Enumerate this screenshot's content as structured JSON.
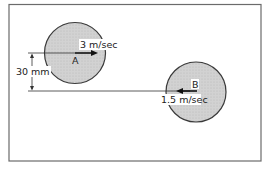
{
  "diagram": {
    "dimension_label": "30 mm",
    "disk_a": {
      "label": "A",
      "velocity_label": "3 m/sec",
      "direction": "right"
    },
    "disk_b": {
      "label": "B",
      "velocity_label": "1.5 m/sec",
      "direction": "left"
    },
    "colors": {
      "frame": "#6b6b6b",
      "disk_fill": "#cfcfcf",
      "disk_stroke": "#3a3a3a",
      "line": "#333333"
    }
  }
}
